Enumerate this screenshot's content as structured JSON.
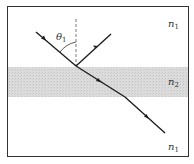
{
  "diagram": {
    "labels": {
      "angle": "θ",
      "angle_sub": "1",
      "top_medium": "n",
      "top_medium_sub": "1",
      "middle_medium": "n",
      "middle_medium_sub": "2",
      "bottom_medium": "n",
      "bottom_medium_sub": "1"
    },
    "colors": {
      "frame": "#333333",
      "band": "#d9d9d9",
      "ray": "#1a1a1a",
      "normal": "#555555"
    }
  }
}
